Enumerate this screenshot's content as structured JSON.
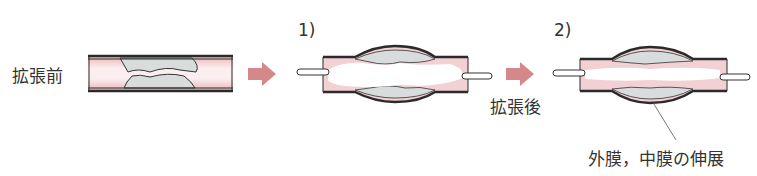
{
  "stages": [
    {
      "id": "before",
      "label": "拡張前"
    },
    {
      "id": "step1",
      "label": "1)"
    },
    {
      "id": "step2",
      "label": "2)"
    }
  ],
  "after_label": "拡張後",
  "annotation": "外膜，中膜の伸展",
  "colors": {
    "arrow": "#d4888a",
    "intima_pink": "#f2d0d3",
    "plaque_gray": "#d9dcdc",
    "wall_line": "#2a2a2a"
  }
}
